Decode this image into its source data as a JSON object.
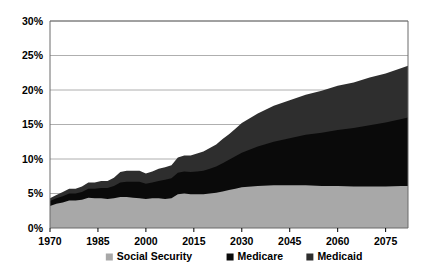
{
  "chart_data": {
    "type": "area",
    "stacked": true,
    "title": "",
    "subtitle": "",
    "xlabel": "",
    "ylabel": "",
    "xlim": [
      1970,
      2082
    ],
    "ylim": [
      0,
      30
    ],
    "grid": true,
    "legend_position": "bottom",
    "y_tick_labels": [
      "0%",
      "5%",
      "10%",
      "15%",
      "20%",
      "25%",
      "30%"
    ],
    "y_tick_values": [
      0,
      5,
      10,
      15,
      20,
      25,
      30
    ],
    "x_tick_labels": [
      "1970",
      "1985",
      "2000",
      "2015",
      "2030",
      "2045",
      "2060",
      "2075"
    ],
    "x_tick_values": [
      1970,
      1985,
      2000,
      2015,
      2030,
      2045,
      2060,
      2075
    ],
    "series": [
      {
        "name": "Social Security",
        "color": "#a8a8a8",
        "x": [
          1970,
          1972,
          1974,
          1976,
          1978,
          1980,
          1982,
          1984,
          1986,
          1988,
          1990,
          1992,
          1994,
          1996,
          1998,
          2000,
          2002,
          2004,
          2006,
          2008,
          2010,
          2012,
          2014,
          2016,
          2018,
          2020,
          2022,
          2024,
          2026,
          2028,
          2030,
          2035,
          2040,
          2045,
          2050,
          2055,
          2060,
          2065,
          2070,
          2075,
          2080,
          2082
        ],
        "values": [
          3.2,
          3.5,
          3.7,
          4.0,
          4.0,
          4.1,
          4.4,
          4.3,
          4.3,
          4.2,
          4.3,
          4.5,
          4.5,
          4.4,
          4.3,
          4.2,
          4.3,
          4.3,
          4.2,
          4.3,
          4.9,
          5.0,
          4.9,
          4.9,
          4.9,
          5.0,
          5.1,
          5.3,
          5.5,
          5.7,
          5.9,
          6.1,
          6.2,
          6.2,
          6.2,
          6.1,
          6.1,
          6.0,
          6.0,
          6.0,
          6.1,
          6.1
        ]
      },
      {
        "name": "Medicare",
        "color": "#0a0a0a",
        "x": [
          1970,
          1972,
          1974,
          1976,
          1978,
          1980,
          1982,
          1984,
          1986,
          1988,
          1990,
          1992,
          1994,
          1996,
          1998,
          2000,
          2002,
          2004,
          2006,
          2008,
          2010,
          2012,
          2014,
          2016,
          2018,
          2020,
          2022,
          2024,
          2026,
          2028,
          2030,
          2035,
          2040,
          2045,
          2050,
          2055,
          2060,
          2065,
          2070,
          2075,
          2080,
          2082
        ],
        "values": [
          0.7,
          0.8,
          0.9,
          1.0,
          1.0,
          1.1,
          1.3,
          1.4,
          1.5,
          1.6,
          1.8,
          2.1,
          2.2,
          2.3,
          2.4,
          2.2,
          2.3,
          2.5,
          2.8,
          2.9,
          3.1,
          3.2,
          3.2,
          3.3,
          3.4,
          3.6,
          3.8,
          4.1,
          4.4,
          4.7,
          5.0,
          5.7,
          6.3,
          6.8,
          7.3,
          7.7,
          8.1,
          8.5,
          8.9,
          9.3,
          9.7,
          9.9
        ],
        "cumulative_top": [
          3.9,
          4.3,
          4.6,
          5.0,
          5.0,
          5.2,
          5.7,
          5.7,
          5.8,
          5.8,
          6.1,
          6.6,
          6.7,
          6.7,
          6.7,
          6.4,
          6.6,
          6.8,
          7.0,
          7.2,
          8.0,
          8.2,
          8.1,
          8.2,
          8.3,
          8.6,
          8.9,
          9.4,
          9.9,
          10.4,
          10.9,
          11.8,
          12.5,
          13.0,
          13.5,
          13.8,
          14.2,
          14.5,
          14.9,
          15.3,
          15.8,
          16.0
        ]
      },
      {
        "name": "Medicaid",
        "color": "#2e2e2e",
        "x": [
          1970,
          1972,
          1974,
          1976,
          1978,
          1980,
          1982,
          1984,
          1986,
          1988,
          1990,
          1992,
          1994,
          1996,
          1998,
          2000,
          2002,
          2004,
          2006,
          2008,
          2010,
          2012,
          2014,
          2016,
          2018,
          2020,
          2022,
          2024,
          2026,
          2028,
          2030,
          2035,
          2040,
          2045,
          2050,
          2055,
          2060,
          2065,
          2070,
          2075,
          2080,
          2082
        ],
        "values": [
          0.4,
          0.5,
          0.6,
          0.7,
          0.7,
          0.8,
          0.9,
          0.9,
          1.0,
          1.0,
          1.2,
          1.5,
          1.6,
          1.6,
          1.6,
          1.5,
          1.6,
          1.8,
          1.8,
          1.9,
          2.2,
          2.3,
          2.4,
          2.6,
          2.8,
          3.0,
          3.2,
          3.5,
          3.7,
          4.0,
          4.3,
          4.8,
          5.2,
          5.5,
          5.8,
          6.1,
          6.4,
          6.6,
          6.9,
          7.1,
          7.4,
          7.5
        ],
        "cumulative_top": [
          4.3,
          4.8,
          5.2,
          5.7,
          5.7,
          6.0,
          6.6,
          6.6,
          6.8,
          6.8,
          7.3,
          8.1,
          8.3,
          8.3,
          8.3,
          7.9,
          8.2,
          8.6,
          8.8,
          9.1,
          10.2,
          10.5,
          10.5,
          10.8,
          11.1,
          11.6,
          12.1,
          12.9,
          13.6,
          14.4,
          15.2,
          16.6,
          17.7,
          18.5,
          19.3,
          19.9,
          20.6,
          21.1,
          21.8,
          22.4,
          23.2,
          23.5
        ]
      }
    ]
  },
  "legend": {
    "items": [
      {
        "label": "Social Security",
        "color": "#a8a8a8"
      },
      {
        "label": "Medicare",
        "color": "#0a0a0a"
      },
      {
        "label": "Medicaid",
        "color": "#2e2e2e"
      }
    ]
  },
  "colors": {
    "social_security": "#a8a8a8",
    "medicare": "#0a0a0a",
    "medicaid": "#2e2e2e",
    "gridline": "#9a9a9a",
    "axis": "#6b6b6b",
    "background": "#ffffff",
    "text": "#000000"
  }
}
